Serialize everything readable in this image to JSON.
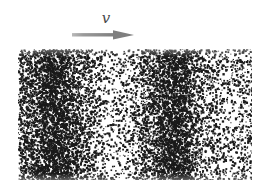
{
  "figure": {
    "type": "particle-density-wave-figure",
    "background_color": "#ffffff",
    "panel": {
      "x": 18,
      "y": 49,
      "width": 234,
      "height": 131,
      "border": "none",
      "background_color": "#ffffff",
      "particle_color": "#1a1a1a"
    },
    "annotation": {
      "velocity_label": "v",
      "velocity_label_style": "italic",
      "velocity_label_color": "#4a4a4a",
      "arrow_direction": "right",
      "arrow_color": "#8c8c8c",
      "arrow_x": 72,
      "arrow_y": 68,
      "arrow_length": 62
    }
  },
  "chart_data": {
    "type": "scatter",
    "title": "",
    "subtitle": "",
    "xlabel": "",
    "ylabel": "",
    "xlim": [
      0,
      234
    ],
    "ylim": [
      0,
      131
    ],
    "grid": false,
    "legend": null,
    "annotations": [
      {
        "text": "v",
        "style": "italic",
        "x": 96,
        "y": 20,
        "kind": "velocity-label"
      },
      {
        "text": "",
        "kind": "velocity-arrow",
        "x1": 72,
        "y1": 68,
        "x2": 134,
        "y2": 68,
        "direction": "right"
      }
    ],
    "n_points": 9000,
    "point_size_px": 1.4,
    "density_profile": {
      "xlabel": "x position across panel (px)",
      "ylabel": "relative particle number density",
      "x": [
        0,
        10,
        20,
        28,
        36,
        44,
        52,
        60,
        68,
        76,
        84,
        92,
        100,
        108,
        116,
        124,
        132,
        140,
        148,
        156,
        164,
        172,
        180,
        188,
        196,
        204,
        212,
        220,
        228,
        234
      ],
      "values": [
        0.62,
        0.74,
        0.88,
        0.97,
        1.0,
        0.99,
        0.92,
        0.78,
        0.6,
        0.42,
        0.3,
        0.24,
        0.22,
        0.26,
        0.36,
        0.54,
        0.74,
        0.9,
        0.99,
        1.0,
        0.93,
        0.76,
        0.55,
        0.38,
        0.27,
        0.22,
        0.24,
        0.3,
        0.34,
        0.32
      ],
      "peaks_x": [
        36,
        156
      ],
      "troughs_x": [
        100,
        204
      ]
    }
  }
}
